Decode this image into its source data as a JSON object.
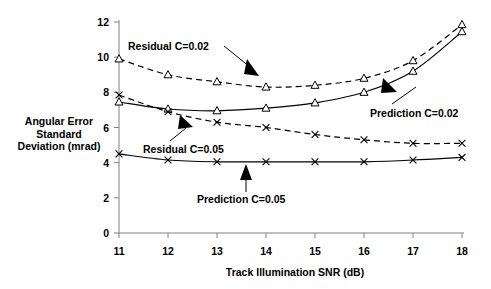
{
  "chart_data": {
    "type": "line",
    "title": "",
    "subtitle": "",
    "xlabel": "Track Illumination SNR (dB)",
    "ylabel": "Angular Error Standard Deviation (mrad)",
    "ylabel_lines": [
      "Angular Error",
      "Standard",
      "Deviation (mrad)"
    ],
    "x": [
      11,
      12,
      13,
      14,
      15,
      16,
      17,
      18
    ],
    "xlim": [
      11,
      18
    ],
    "ylim": [
      0,
      12
    ],
    "xticks": [
      11,
      12,
      13,
      14,
      15,
      16,
      17,
      18
    ],
    "yticks": [
      0,
      2,
      4,
      6,
      8,
      10,
      12
    ],
    "xtick_labels": [
      "11",
      "12",
      "13",
      "14",
      "15",
      "16",
      "17",
      "18"
    ],
    "ytick_labels": [
      "0",
      "2",
      "4",
      "6",
      "8",
      "10",
      "12"
    ],
    "grid": false,
    "legend": "inline-annotations",
    "series": [
      {
        "name": "Residual C=0.02",
        "values": [
          9.9,
          9.0,
          8.6,
          8.3,
          8.4,
          8.8,
          9.8,
          11.85
        ],
        "style": "dashed",
        "marker": "triangle-up-open",
        "color": "#000000"
      },
      {
        "name": "Prediction C=0.02",
        "values": [
          7.45,
          7.05,
          6.95,
          7.1,
          7.4,
          8.0,
          9.2,
          11.45
        ],
        "style": "solid",
        "marker": "triangle-up-open",
        "color": "#000000"
      },
      {
        "name": "Residual C=0.05",
        "values": [
          7.85,
          6.9,
          6.3,
          6.0,
          5.6,
          5.3,
          5.1,
          5.1
        ],
        "style": "dashed",
        "marker": "x",
        "color": "#000000"
      },
      {
        "name": "Prediction C=0.05",
        "values": [
          4.5,
          4.15,
          4.05,
          4.05,
          4.05,
          4.05,
          4.15,
          4.3
        ],
        "style": "solid",
        "marker": "x",
        "color": "#000000"
      }
    ],
    "annotations": [
      {
        "text": "Residual C=0.02",
        "points_to_series": "Residual C=0.02",
        "arrow": "down-right"
      },
      {
        "text": "Prediction C=0.02",
        "points_to_series": "Prediction C=0.02",
        "arrow": "up-left"
      },
      {
        "text": "Residual C=0.05",
        "points_to_series": "Residual C=0.05",
        "arrow": "up-right"
      },
      {
        "text": "Prediction C=0.05",
        "points_to_series": "Prediction C=0.05",
        "arrow": "up"
      }
    ]
  }
}
